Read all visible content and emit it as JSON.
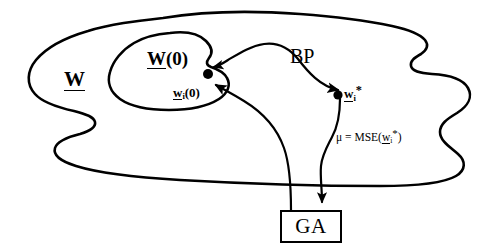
{
  "figure": {
    "background_color": "#ffffff",
    "stroke_color": "#000000",
    "width": 501,
    "height": 251
  },
  "regions": {
    "outer_set_label": "W",
    "inner_set_label": "W(0)"
  },
  "points": {
    "initial_weight_label_base": "w",
    "initial_weight_label_sub": "i",
    "initial_weight_label_suffix": "(0)",
    "optimal_weight_label_base": "w",
    "optimal_weight_label_sub": "i",
    "optimal_weight_label_star": "*"
  },
  "labels": {
    "bp": "BP",
    "ga": "GA",
    "mse_prefix": "μ = MSE(",
    "mse_base": "w",
    "mse_sub": "i",
    "mse_star": "*",
    "mse_suffix": ")"
  },
  "connections": [
    {
      "name": "bp-arrow",
      "from": "w_i(0)",
      "to": "w_i*",
      "annotation": "BP",
      "arrowhead": true
    },
    {
      "name": "mse-arrow",
      "from": "w_i*",
      "to": "GA",
      "annotation": "μ = MSE(w_i*)",
      "arrowhead": true
    },
    {
      "name": "ga-feedback-arrow",
      "from": "GA",
      "to": "w_i(0)",
      "annotation": "",
      "arrowhead": true
    }
  ]
}
